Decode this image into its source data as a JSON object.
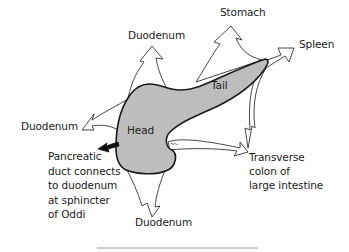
{
  "diagram": {
    "type": "anatomy-relations",
    "parts": [
      {
        "id": "head",
        "label": "Head"
      },
      {
        "id": "tail",
        "label": "Tail"
      }
    ],
    "neighbors": [
      {
        "id": "duodenum-top",
        "label": "Duodenum"
      },
      {
        "id": "stomach",
        "label": "Stomach"
      },
      {
        "id": "spleen",
        "label": "Spleen"
      },
      {
        "id": "duodenum-left",
        "label": "Duodenum"
      },
      {
        "id": "duodenum-bottom",
        "label": "Duodenum"
      },
      {
        "id": "transverse-colon",
        "label": "Transverse\ncolon of\nlarge intestine"
      }
    ],
    "annotations": [
      {
        "id": "pancreatic-duct",
        "label": "Pancreatic\nduct connects\nto duodenum\nat sphincter\nof Oddi"
      }
    ],
    "colors": {
      "organ_fill": "#bdbdbd",
      "outline": "#1a1a1a",
      "arrow_stroke": "#333333",
      "duct_arrow": "#111111",
      "rule": "#9a9a9a"
    }
  }
}
